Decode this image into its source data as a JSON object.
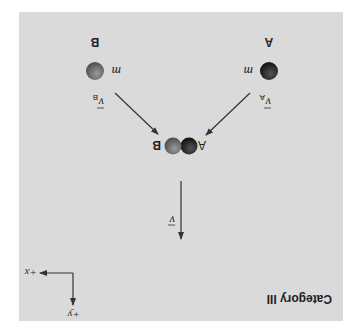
{
  "figure": {
    "title": "Category III",
    "orientation": "rotated-180",
    "background_color": "#dadada",
    "ball_a_color": "#1e1e1e",
    "ball_b_color": "#6a6a6a",
    "arrow_color": "#333333"
  },
  "objects": {
    "ball_a": {
      "label": "A",
      "mass_label": "m",
      "velocity_symbol": "v",
      "velocity_subscript": "A"
    },
    "ball_b": {
      "label": "B",
      "mass_label": "m",
      "velocity_symbol": "v",
      "velocity_subscript": "B"
    },
    "combined": {
      "label_a": "A",
      "label_b": "B",
      "velocity_symbol": "v"
    }
  },
  "axes": {
    "x_label": "+x",
    "y_label": "+y"
  }
}
